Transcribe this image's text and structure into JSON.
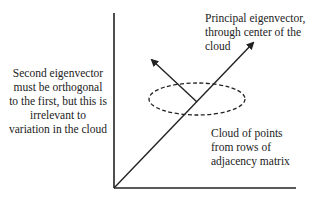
{
  "labels": {
    "second_eigenvector": {
      "lines": [
        "Second eigenvector",
        "must be orthogonal",
        "to the first, but this is",
        "irrelevant to",
        "variation in the cloud"
      ]
    },
    "principal_eigenvector": {
      "lines": [
        "Principal eigenvector,",
        "through center of the",
        "cloud"
      ]
    },
    "cloud": {
      "lines": [
        "Cloud of points",
        "from rows of",
        "adjacency matrix"
      ]
    }
  },
  "colors": {
    "line": "#222222",
    "background": "#ffffff"
  }
}
